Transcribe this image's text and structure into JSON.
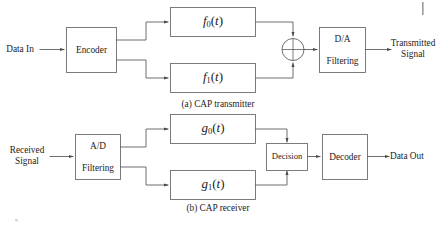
{
  "figure": {
    "background_color": "#ffffff",
    "line_color": "#5d5d5d",
    "box_stroke_color": "#6e6e6e",
    "text_color": "#1c1c1c",
    "width": 438,
    "height": 227
  },
  "transmitter": {
    "caption": "(a)  CAP transmitter",
    "input_label_line1": "Data In",
    "encoder_label": "Encoder",
    "filter_top": {
      "base": "f",
      "subscript": "0",
      "arg_open": "(",
      "variable": "t",
      "arg_close": ")"
    },
    "filter_bottom": {
      "base": "f",
      "subscript": "1",
      "arg_open": "(",
      "variable": "t",
      "arg_close": ")"
    },
    "summer": {
      "symbol": "+",
      "name": "summing-junction"
    },
    "da_label_line1": "D/A",
    "da_label_line2": "Filtering",
    "output_label_line1": "Transmitted",
    "output_label_line2": "Signal"
  },
  "receiver": {
    "caption": "(b)  CAP receiver",
    "input_label_line1": "Received",
    "input_label_line2": "Signal",
    "ad_label_line1": "A/D",
    "ad_label_line2": "Filtering",
    "matched_top": {
      "base": "g",
      "subscript": "0",
      "arg_open": "(",
      "variable": "t",
      "arg_close": ")"
    },
    "matched_bottom": {
      "base": "g",
      "subscript": "1",
      "arg_open": "(",
      "variable": "t",
      "arg_close": ")"
    },
    "decision_label": "Decision",
    "decoder_label": "Decoder",
    "output_label_line1": "Data Out"
  }
}
